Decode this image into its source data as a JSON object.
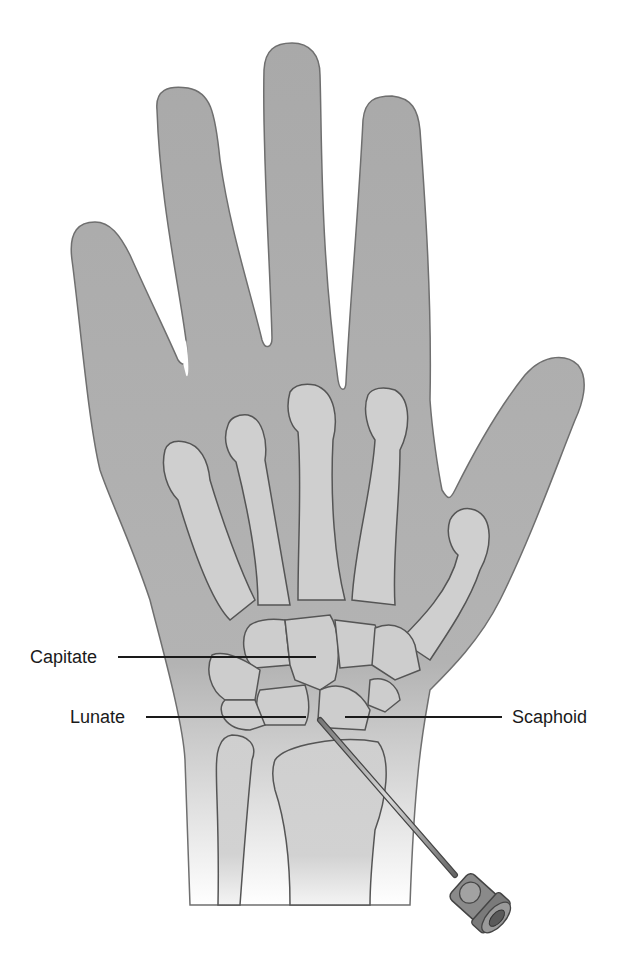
{
  "figure": {
    "colors": {
      "skin": "#a9a9a9",
      "skin_outline": "#6f6f6f",
      "bone": "#cfcfcf",
      "bone_outline": "#555555",
      "label_text": "#1a1a1a",
      "background": "#ffffff"
    },
    "labels": [
      {
        "id": "capitate",
        "text": "Capitate"
      },
      {
        "id": "lunate",
        "text": "Lunate"
      },
      {
        "id": "scaphoid",
        "text": "Scaphoid"
      }
    ],
    "instrument": {
      "name": "needle-syringe-icon"
    }
  }
}
